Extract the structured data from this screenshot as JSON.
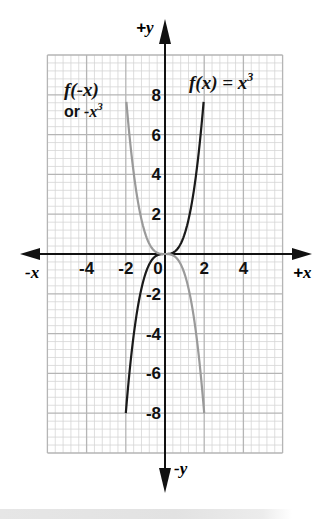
{
  "chart_data": {
    "type": "line",
    "title": "",
    "xlabel_positive": "+x",
    "xlabel_negative": "-x",
    "ylabel_positive": "+y",
    "ylabel_negative": "-y",
    "xlim": [
      -6,
      6
    ],
    "ylim": [
      -10,
      10
    ],
    "grid": true,
    "grid_major_step": 2,
    "grid_minor_per_major": 5,
    "x_ticks": [
      -4,
      -2,
      0,
      2,
      4
    ],
    "x_tick_labels": [
      "-4",
      "-2",
      "0",
      "2",
      "4"
    ],
    "y_ticks": [
      8,
      6,
      4,
      2,
      -2,
      -4,
      -6,
      -8
    ],
    "y_tick_labels": [
      "8",
      "6",
      "4",
      "2",
      "-2",
      "-4",
      "-6",
      "-8"
    ],
    "series": [
      {
        "name": "f(x) = x^3",
        "label_parts": [
          "f",
          "(",
          "x",
          ") = ",
          "x",
          "3"
        ],
        "color": "#1a1a1a",
        "x": [
          -2.0,
          -1.75,
          -1.5,
          -1.25,
          -1.0,
          -0.75,
          -0.5,
          -0.25,
          0.0,
          0.25,
          0.5,
          0.75,
          1.0,
          1.25,
          1.5,
          1.75,
          1.97
        ],
        "y": [
          -8.0,
          -5.36,
          -3.38,
          -1.95,
          -1.0,
          -0.42,
          -0.13,
          -0.02,
          0.0,
          0.02,
          0.13,
          0.42,
          1.0,
          1.95,
          3.38,
          5.36,
          7.65
        ]
      },
      {
        "name": "f(-x) or -x^3",
        "label_line1": [
          "f",
          "(-",
          "x",
          ")"
        ],
        "label_line2": [
          "or",
          " -",
          "x",
          "3"
        ],
        "color": "#9a9a9a",
        "x": [
          -1.97,
          -1.75,
          -1.5,
          -1.25,
          -1.0,
          -0.75,
          -0.5,
          -0.25,
          0.0,
          0.25,
          0.5,
          0.75,
          1.0,
          1.25,
          1.5,
          1.75,
          2.0
        ],
        "y": [
          7.65,
          5.36,
          3.38,
          1.95,
          1.0,
          0.42,
          0.13,
          0.02,
          0.0,
          -0.02,
          -0.13,
          -0.42,
          -1.0,
          -1.95,
          -3.38,
          -5.36,
          -8.0
        ]
      }
    ],
    "legend": "inline labels"
  }
}
